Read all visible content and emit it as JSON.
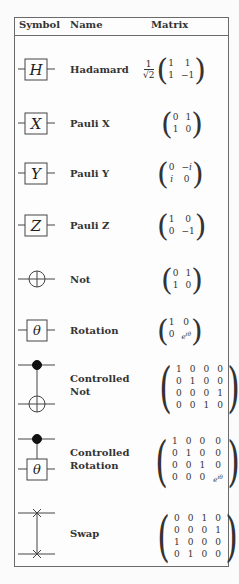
{
  "header": {
    "symbol": "Symbol",
    "name": "Name",
    "matrix": "Matrix"
  },
  "gates": [
    {
      "id": "hadamard",
      "label": "H",
      "name": "Hadamard",
      "prefactor_num": "1",
      "prefactor_den": "√2",
      "matrix": [
        [
          "1",
          "1"
        ],
        [
          "1",
          "−1"
        ]
      ]
    },
    {
      "id": "pauli-x",
      "label": "X",
      "name": "Pauli X",
      "matrix": [
        [
          "0",
          "1"
        ],
        [
          "1",
          "0"
        ]
      ]
    },
    {
      "id": "pauli-y",
      "label": "Y",
      "name": "Pauli Y",
      "matrix": [
        [
          "0",
          "−i"
        ],
        [
          "i",
          "0"
        ]
      ]
    },
    {
      "id": "pauli-z",
      "label": "Z",
      "name": "Pauli Z",
      "matrix": [
        [
          "1",
          "0"
        ],
        [
          "0",
          "−1"
        ]
      ]
    },
    {
      "id": "not",
      "label": "⊕",
      "name": "Not",
      "matrix": [
        [
          "0",
          "1"
        ],
        [
          "1",
          "0"
        ]
      ]
    },
    {
      "id": "rotation",
      "label": "θ",
      "name": "Rotation",
      "matrix": [
        [
          "1",
          "0"
        ],
        [
          "0",
          "e^{iθ}"
        ]
      ]
    },
    {
      "id": "controlled-not",
      "label": "",
      "name_line1": "Controlled",
      "name_line2": "Not",
      "matrix": [
        [
          "1",
          "0",
          "0",
          "0"
        ],
        [
          "0",
          "1",
          "0",
          "0"
        ],
        [
          "0",
          "0",
          "0",
          "1"
        ],
        [
          "0",
          "0",
          "1",
          "0"
        ]
      ]
    },
    {
      "id": "controlled-rotation",
      "label": "θ",
      "name_line1": "Controlled",
      "name_line2": "Rotation",
      "matrix": [
        [
          "1",
          "0",
          "0",
          "0"
        ],
        [
          "0",
          "1",
          "0",
          "0"
        ],
        [
          "0",
          "0",
          "1",
          "0"
        ],
        [
          "0",
          "0",
          "0",
          "e^{iθ}"
        ]
      ]
    },
    {
      "id": "swap",
      "label": "",
      "name": "Swap",
      "matrix": [
        [
          "0",
          "0",
          "1",
          "0"
        ],
        [
          "0",
          "0",
          "0",
          "1"
        ],
        [
          "1",
          "0",
          "0",
          "0"
        ],
        [
          "0",
          "1",
          "0",
          "0"
        ]
      ]
    }
  ]
}
